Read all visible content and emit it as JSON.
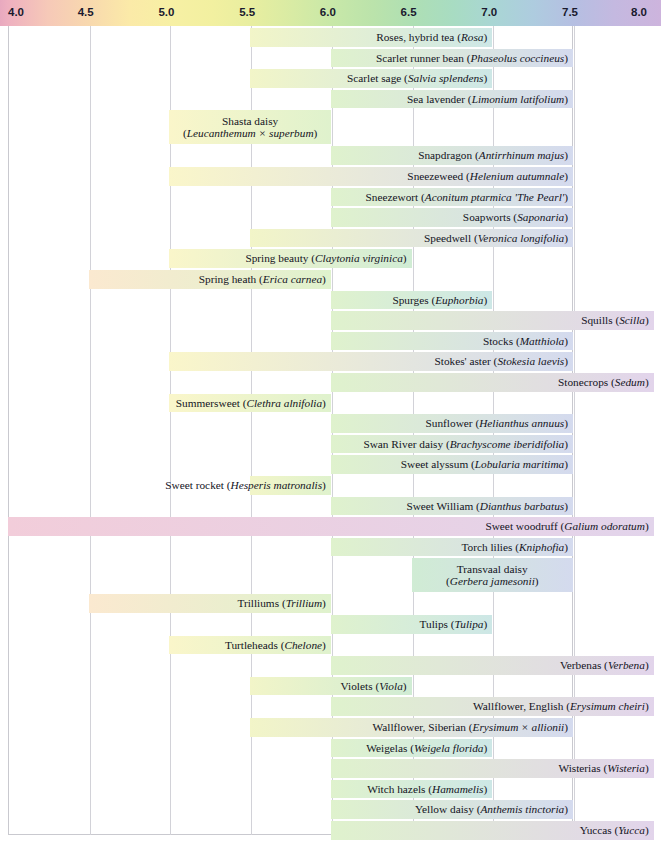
{
  "chart_data": {
    "type": "bar",
    "orientation": "horizontal",
    "title": "",
    "xlabel": "",
    "ylabel": "",
    "xlim": [
      4.0,
      8.0
    ],
    "grid": true,
    "legend": "none",
    "axis": {
      "tick_labels": [
        "4.0",
        "4.5",
        "5.0",
        "5.5",
        "6.0",
        "6.5",
        "7.0",
        "7.5",
        "8.0"
      ],
      "tick_values": [
        4.0,
        4.5,
        5.0,
        5.5,
        6.0,
        6.5,
        7.0,
        7.5,
        8.0
      ],
      "gradient_stops": [
        {
          "ph": 4.0,
          "color": "#e8a9bf"
        },
        {
          "ph": 4.5,
          "color": "#f8d9ae"
        },
        {
          "ph": 5.0,
          "color": "#f7f0a4"
        },
        {
          "ph": 5.5,
          "color": "#e8eea0"
        },
        {
          "ph": 6.0,
          "color": "#c8e8a8"
        },
        {
          "ph": 6.5,
          "color": "#aedfb4"
        },
        {
          "ph": 7.0,
          "color": "#a9d6d4"
        },
        {
          "ph": 7.5,
          "color": "#b5bfe2"
        },
        {
          "ph": 8.0,
          "color": "#cdb4dd"
        }
      ]
    },
    "bars": [
      {
        "common": "Roses, hybrid tea",
        "latin": "Rosa",
        "start": 5.5,
        "end": 7.0,
        "lines": 1
      },
      {
        "common": "Scarlet runner bean",
        "latin": "Phaseolus coccineus",
        "start": 6.0,
        "end": 7.5,
        "lines": 1
      },
      {
        "common": "Scarlet sage",
        "latin": "Salvia splendens",
        "start": 5.5,
        "end": 7.0,
        "lines": 1
      },
      {
        "common": "Sea lavender",
        "latin": "Limonium latifolium",
        "start": 6.0,
        "end": 7.5,
        "lines": 1
      },
      {
        "common": "Shasta daisy",
        "latin": "Leucanthemum × superbum",
        "start": 5.0,
        "end": 6.0,
        "lines": 2
      },
      {
        "common": "Snapdragon",
        "latin": "Antirrhinum majus",
        "start": 6.0,
        "end": 7.5,
        "lines": 1
      },
      {
        "common": "Sneezeweed",
        "latin": "Helenium autumnale",
        "start": 5.0,
        "end": 7.5,
        "lines": 1
      },
      {
        "common": "Sneezewort",
        "latin": "Aconitum ptarmica 'The Pearl'",
        "start": 6.0,
        "end": 7.5,
        "lines": 1
      },
      {
        "common": "Soapworts",
        "latin": "Saponaria",
        "start": 6.0,
        "end": 7.5,
        "lines": 1
      },
      {
        "common": "Speedwell",
        "latin": "Veronica longifolia",
        "start": 5.5,
        "end": 7.5,
        "lines": 1
      },
      {
        "common": "Spring beauty",
        "latin": "Claytonia virginica",
        "start": 5.0,
        "end": 6.5,
        "lines": 1
      },
      {
        "common": "Spring heath",
        "latin": "Erica carnea",
        "start": 4.5,
        "end": 6.0,
        "lines": 1
      },
      {
        "common": "Spurges",
        "latin": "Euphorbia",
        "start": 6.0,
        "end": 7.0,
        "lines": 1
      },
      {
        "common": "Squills",
        "latin": "Scilla",
        "start": 6.0,
        "end": 8.0,
        "lines": 1
      },
      {
        "common": "Stocks",
        "latin": "Matthiola",
        "start": 6.0,
        "end": 7.5,
        "lines": 1
      },
      {
        "common": "Stokes' aster",
        "latin": "Stokesia laevis",
        "start": 5.0,
        "end": 7.5,
        "lines": 1
      },
      {
        "common": "Stonecrops",
        "latin": "Sedum",
        "start": 6.0,
        "end": 8.0,
        "lines": 1
      },
      {
        "common": "Summersweet",
        "latin": "Clethra alnifolia",
        "start": 5.0,
        "end": 6.0,
        "lines": 1
      },
      {
        "common": "Sunflower",
        "latin": "Helianthus annuus",
        "start": 6.0,
        "end": 7.5,
        "lines": 1
      },
      {
        "common": "Swan River daisy",
        "latin": "Brachyscome iberidifolia",
        "start": 6.0,
        "end": 7.5,
        "lines": 1
      },
      {
        "common": "Sweet alyssum",
        "latin": "Lobularia maritima",
        "start": 6.0,
        "end": 7.5,
        "lines": 1
      },
      {
        "common": "Sweet rocket",
        "latin": "Hesperis matronalis",
        "start": 5.5,
        "end": 6.0,
        "lines": 1
      },
      {
        "common": "Sweet William",
        "latin": "Dianthus barbatus",
        "start": 6.0,
        "end": 7.5,
        "lines": 1
      },
      {
        "common": "Sweet woodruff",
        "latin": "Galium odoratum",
        "start": 4.0,
        "end": 8.0,
        "lines": 1
      },
      {
        "common": "Torch lilies",
        "latin": "Kniphofia",
        "start": 6.0,
        "end": 7.5,
        "lines": 1
      },
      {
        "common": "Transvaal daisy",
        "latin": "Gerbera jamesonii",
        "start": 6.5,
        "end": 7.5,
        "lines": 2
      },
      {
        "common": "Trilliums",
        "latin": "Trillium",
        "start": 4.5,
        "end": 6.0,
        "lines": 1
      },
      {
        "common": "Tulips",
        "latin": "Tulipa",
        "start": 6.0,
        "end": 7.0,
        "lines": 1
      },
      {
        "common": "Turtleheads",
        "latin": "Chelone",
        "start": 5.0,
        "end": 6.0,
        "lines": 1
      },
      {
        "common": "Verbenas",
        "latin": "Verbena",
        "start": 6.0,
        "end": 8.0,
        "lines": 1
      },
      {
        "common": "Violets",
        "latin": "Viola",
        "start": 5.5,
        "end": 6.5,
        "lines": 1
      },
      {
        "common": "Wallflower, English",
        "latin": "Erysimum cheiri",
        "start": 6.0,
        "end": 8.0,
        "lines": 1
      },
      {
        "common": "Wallflower, Siberian",
        "latin": "Erysimum × allionii",
        "start": 5.5,
        "end": 7.5,
        "lines": 1
      },
      {
        "common": "Weigelas",
        "latin": "Weigela florida",
        "start": 6.0,
        "end": 7.0,
        "lines": 1
      },
      {
        "common": "Wisterias",
        "latin": "Wisteria",
        "start": 6.0,
        "end": 8.0,
        "lines": 1
      },
      {
        "common": "Witch hazels",
        "latin": "Hamamelis",
        "start": 6.0,
        "end": 7.0,
        "lines": 1
      },
      {
        "common": "Yellow daisy",
        "latin": "Anthemis tinctoria",
        "start": 6.0,
        "end": 7.5,
        "lines": 1
      },
      {
        "common": "Yuccas",
        "latin": "Yucca",
        "start": 6.0,
        "end": 8.0,
        "lines": 1
      },
      {
        "common": "Zinnias",
        "latin": "Zinnia",
        "start": 5.5,
        "end": 7.5,
        "lines": 1
      }
    ]
  }
}
